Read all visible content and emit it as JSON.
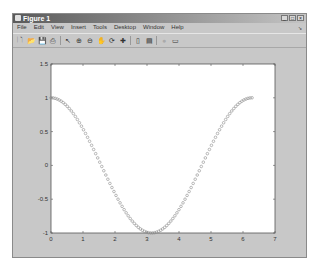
{
  "window": {
    "title": "Figure 1",
    "buttons": {
      "minimize": "_",
      "maximize": "□",
      "close": "×"
    }
  },
  "menubar": {
    "items": [
      {
        "label": "File"
      },
      {
        "label": "Edit"
      },
      {
        "label": "View"
      },
      {
        "label": "Insert"
      },
      {
        "label": "Tools"
      },
      {
        "label": "Desktop"
      },
      {
        "label": "Window"
      },
      {
        "label": "Help"
      }
    ],
    "dock_arrow": "➘"
  },
  "toolbar": {
    "icons": [
      {
        "name": "new-figure-icon",
        "glyph": "🗋"
      },
      {
        "name": "open-icon",
        "glyph": "📂"
      },
      {
        "name": "save-icon",
        "glyph": "💾"
      },
      {
        "name": "print-icon",
        "glyph": "⎙"
      },
      {
        "name": "edit-plot-icon",
        "glyph": "↖"
      },
      {
        "name": "zoom-in-icon",
        "glyph": "⊕"
      },
      {
        "name": "zoom-out-icon",
        "glyph": "⊖"
      },
      {
        "name": "pan-icon",
        "glyph": "✋"
      },
      {
        "name": "rotate-3d-icon",
        "glyph": "⟳"
      },
      {
        "name": "data-cursor-icon",
        "glyph": "✚"
      },
      {
        "name": "colorbar-icon",
        "glyph": "▯"
      },
      {
        "name": "legend-icon",
        "glyph": "▤"
      },
      {
        "name": "hide-plot-tools-icon",
        "glyph": "●"
      },
      {
        "name": "show-plot-tools-icon",
        "glyph": "▭"
      }
    ]
  },
  "chart_data": {
    "type": "line",
    "title": "",
    "xlabel": "",
    "ylabel": "",
    "xlim": [
      0,
      7
    ],
    "ylim": [
      -1,
      1.5
    ],
    "xticks": [
      "0",
      "1",
      "2",
      "3",
      "4",
      "5",
      "6",
      "7"
    ],
    "yticks": [
      "-1",
      "-0.5",
      "0",
      "0.5",
      "1",
      "1.5"
    ],
    "grid": false,
    "legend": null,
    "series": [
      {
        "name": "cos(x)",
        "marker": "o",
        "color": "#8c8c8c",
        "x_range": [
          0,
          6.2832
        ],
        "points": 100,
        "function": "cos",
        "sample": {
          "x": [
            0,
            0.5,
            1,
            1.5,
            2,
            2.5,
            3,
            3.1416,
            3.5,
            4,
            4.5,
            5,
            5.5,
            6,
            6.2832
          ],
          "y": [
            1,
            0.878,
            0.54,
            0.071,
            -0.416,
            -0.801,
            -0.99,
            -1,
            -0.936,
            -0.654,
            -0.211,
            0.284,
            0.709,
            0.96,
            1
          ]
        }
      }
    ]
  },
  "colors": {
    "figure_bg": "#c8c8c8",
    "axes_bg": "#ffffff",
    "axis_line": "#555555",
    "marker": "#8c8c8c"
  }
}
